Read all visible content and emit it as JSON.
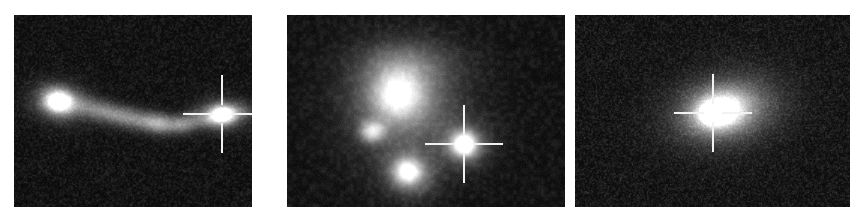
{
  "figure": {
    "kind": "astronomical-cutout-panel-series",
    "panel_count": 3,
    "background_color": "#ffffff",
    "image_colormap": "grayscale",
    "canvas": {
      "width": 859,
      "height": 216
    }
  },
  "marker": {
    "name": "crosshair-marker",
    "color": "#f2f2f2",
    "arm_length": 30,
    "center_gap": 9,
    "thickness": 2
  },
  "panels": [
    {
      "id": "panel-1",
      "label": "",
      "frame": {
        "x": 14,
        "y": 15,
        "width": 238,
        "height": 192
      },
      "background_level": 8,
      "noise": {
        "amplitude": 26,
        "grain": 1.7,
        "seed": 1201
      },
      "crosshair": {
        "x": 208,
        "y": 99
      },
      "sources": [
        {
          "name": "bright-knot-west",
          "x": 44,
          "y": 86,
          "rx": 15,
          "ry": 12,
          "peak": 255,
          "angle": 10
        },
        {
          "name": "knot-halo-west",
          "x": 46,
          "y": 87,
          "rx": 30,
          "ry": 20,
          "peak": 92,
          "angle": 10
        },
        {
          "name": "tidal-stream-inner",
          "x": 85,
          "y": 95,
          "rx": 30,
          "ry": 11,
          "peak": 96,
          "angle": 14
        },
        {
          "name": "tidal-stream-mid",
          "x": 122,
          "y": 104,
          "rx": 30,
          "ry": 11,
          "peak": 104,
          "angle": 12
        },
        {
          "name": "tidal-clump-a",
          "x": 146,
          "y": 108,
          "rx": 16,
          "ry": 10,
          "peak": 112,
          "angle": 8
        },
        {
          "name": "tidal-clump-b",
          "x": 168,
          "y": 110,
          "rx": 13,
          "ry": 9,
          "peak": 88,
          "angle": 5
        },
        {
          "name": "tidal-stream-outer",
          "x": 186,
          "y": 104,
          "rx": 22,
          "ry": 9,
          "peak": 78,
          "angle": 0
        },
        {
          "name": "marked-source",
          "x": 208,
          "y": 99,
          "rx": 13,
          "ry": 9,
          "peak": 255,
          "angle": 0
        },
        {
          "name": "marked-source-halo",
          "x": 208,
          "y": 99,
          "rx": 26,
          "ry": 17,
          "peak": 90,
          "angle": 0
        },
        {
          "name": "faint-extension",
          "x": 228,
          "y": 96,
          "rx": 16,
          "ry": 8,
          "peak": 46,
          "angle": 0
        }
      ]
    },
    {
      "id": "panel-2",
      "label": "",
      "frame": {
        "x": 287,
        "y": 15,
        "width": 278,
        "height": 192
      },
      "background_level": 10,
      "noise": {
        "amplitude": 22,
        "grain": 3.4,
        "seed": 4417
      },
      "crosshair": {
        "x": 177,
        "y": 129
      },
      "sources": [
        {
          "name": "host-galaxy-diffuse",
          "x": 120,
          "y": 95,
          "rx": 68,
          "ry": 66,
          "peak": 52,
          "angle": 0
        },
        {
          "name": "main-blob",
          "x": 113,
          "y": 80,
          "rx": 42,
          "ry": 40,
          "peak": 108,
          "angle": 0
        },
        {
          "name": "main-blob-core",
          "x": 110,
          "y": 78,
          "rx": 24,
          "ry": 24,
          "peak": 126,
          "angle": 0
        },
        {
          "name": "bright-knot-west",
          "x": 85,
          "y": 116,
          "rx": 13,
          "ry": 11,
          "peak": 168,
          "angle": 0
        },
        {
          "name": "lower-blob",
          "x": 122,
          "y": 158,
          "rx": 25,
          "ry": 22,
          "peak": 128,
          "angle": 15
        },
        {
          "name": "lower-blob-core",
          "x": 120,
          "y": 156,
          "rx": 13,
          "ry": 12,
          "peak": 150,
          "angle": 0
        },
        {
          "name": "north-arc",
          "x": 120,
          "y": 46,
          "rx": 52,
          "ry": 22,
          "peak": 44,
          "angle": 0
        },
        {
          "name": "marked-source",
          "x": 177,
          "y": 129,
          "rx": 13,
          "ry": 12,
          "peak": 242,
          "angle": 0
        },
        {
          "name": "marked-source-halo",
          "x": 177,
          "y": 129,
          "rx": 26,
          "ry": 23,
          "peak": 86,
          "angle": 0
        }
      ]
    },
    {
      "id": "panel-3",
      "label": "",
      "frame": {
        "x": 575,
        "y": 15,
        "width": 275,
        "height": 192
      },
      "background_level": 9,
      "noise": {
        "amplitude": 30,
        "grain": 1.5,
        "seed": 9033
      },
      "crosshair": {
        "x": 138,
        "y": 98
      },
      "sources": [
        {
          "name": "host-galaxy-halo",
          "x": 152,
          "y": 94,
          "rx": 62,
          "ry": 40,
          "peak": 58,
          "angle": -12
        },
        {
          "name": "host-galaxy-body",
          "x": 148,
          "y": 95,
          "rx": 42,
          "ry": 27,
          "peak": 118,
          "angle": -12
        },
        {
          "name": "host-galaxy-inner",
          "x": 144,
          "y": 96,
          "rx": 24,
          "ry": 17,
          "peak": 176,
          "angle": -10
        },
        {
          "name": "marked-source",
          "x": 138,
          "y": 98,
          "rx": 11,
          "ry": 9,
          "peak": 255,
          "angle": 0
        },
        {
          "name": "nucleus-core",
          "x": 139,
          "y": 98,
          "rx": 5,
          "ry": 4,
          "peak": 255,
          "angle": 0
        }
      ]
    }
  ]
}
